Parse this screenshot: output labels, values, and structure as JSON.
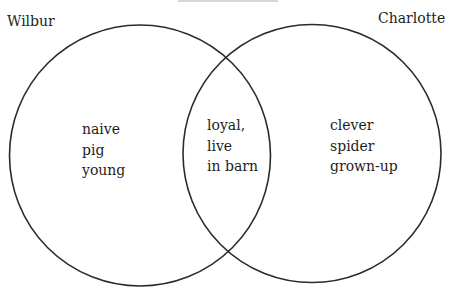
{
  "diagram": {
    "type": "venn",
    "title_visible": false,
    "sets": [
      {
        "name": "Wilbur",
        "label": "Wilbur",
        "center": [
          140,
          155
        ],
        "radius": 131,
        "unique_traits": [
          "naive",
          "pig",
          "young"
        ]
      },
      {
        "name": "Charlotte",
        "label": "Charlotte",
        "center": [
          312,
          154
        ],
        "radius": 129,
        "unique_traits": [
          "clever",
          "spider",
          "grown-up"
        ]
      }
    ],
    "intersection": {
      "traits": [
        "loyal,",
        "live",
        "in barn"
      ]
    },
    "stroke_color": "#2b2b2b",
    "background": "#ffffff"
  },
  "labels": {
    "left": "Wilbur",
    "right": "Charlotte"
  },
  "regions": {
    "left_only": [
      "naive",
      "pig",
      "young"
    ],
    "both": [
      "loyal,",
      "live",
      "in barn"
    ],
    "right_only": [
      "clever",
      "spider",
      "grown-up"
    ]
  }
}
